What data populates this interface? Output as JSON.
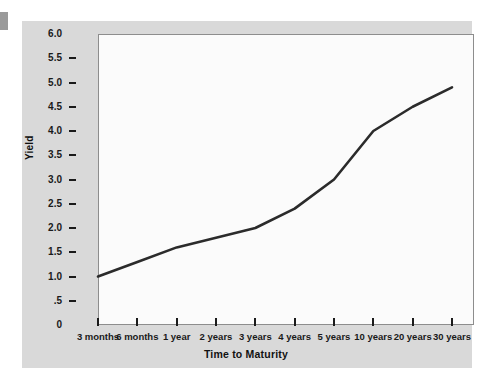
{
  "chart_data": {
    "type": "line",
    "title": "",
    "xlabel": "Time to Maturity",
    "ylabel": "Yield",
    "categories": [
      "3 months",
      "6 months",
      "1 year",
      "2 years",
      "3 years",
      "4 years",
      "5 years",
      "10 years",
      "20 years",
      "30 years"
    ],
    "values": [
      1.0,
      1.3,
      1.6,
      1.8,
      2.0,
      2.4,
      3.0,
      4.0,
      4.5,
      4.9
    ],
    "series": [
      {
        "name": "Yield curve",
        "values": [
          1.0,
          1.3,
          1.6,
          1.8,
          2.0,
          2.4,
          3.0,
          4.0,
          4.5,
          4.9
        ]
      }
    ],
    "ylim": [
      0,
      6.0
    ],
    "y_ticks": [
      0,
      0.5,
      1.0,
      1.5,
      2.0,
      2.5,
      3.0,
      3.5,
      4.0,
      4.5,
      5.0,
      5.5,
      6.0
    ],
    "y_tick_labels": [
      "0",
      ".5",
      "1.0",
      "1.5",
      "2.0",
      "2.5",
      "3.0",
      "3.5",
      "4.0",
      "4.5",
      "5.0",
      "5.5",
      "6.0"
    ],
    "grid": false,
    "legend": "none",
    "line_color": "#2b2b2b",
    "plot_background": "#fbfbfb",
    "figure_background": "#d9d9d9",
    "axis_color": "#8d8d8d"
  },
  "axes": {
    "y_title": "Yield",
    "x_title": "Time to Maturity"
  }
}
